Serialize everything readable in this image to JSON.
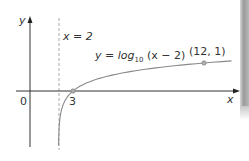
{
  "chart_data": {
    "type": "line",
    "title": "",
    "xlabel": "x",
    "ylabel": "y",
    "function": "y = log10(x - 2)",
    "series": [
      {
        "name": "y = log10(x − 2)",
        "x": [
          2.02,
          2.05,
          2.1,
          2.2,
          2.5,
          3,
          4,
          6,
          8,
          10,
          12,
          14
        ],
        "values": [
          -1.7,
          -1.3,
          -1.0,
          -0.7,
          -0.3,
          0,
          0.301,
          0.602,
          0.778,
          0.903,
          1,
          1.079
        ]
      }
    ],
    "asymptote": {
      "x": 2,
      "label": "x = 2",
      "style": "dashed"
    },
    "points": [
      {
        "x": 3,
        "y": 0,
        "label": "3"
      },
      {
        "x": 12,
        "y": 1,
        "label": "(12, 1)"
      }
    ],
    "origin_label": "0",
    "grid": false,
    "legend": "none",
    "xlim": [
      -1,
      14.5
    ],
    "ylim": [
      -2,
      2.6
    ]
  },
  "labels": {
    "y_axis": "y",
    "x_axis": "x",
    "origin": "0",
    "asymptote": "x = 2",
    "equation_prefix": "y = log",
    "equation_sub": "10",
    "equation_suffix": " (x − 2)",
    "intercept": "3",
    "point": "(12, 1)"
  },
  "colors": {
    "axis": "#333333",
    "curve": "#8a8a8a",
    "asymptote": "#aaaaaa",
    "point": "#9a9a9a"
  }
}
